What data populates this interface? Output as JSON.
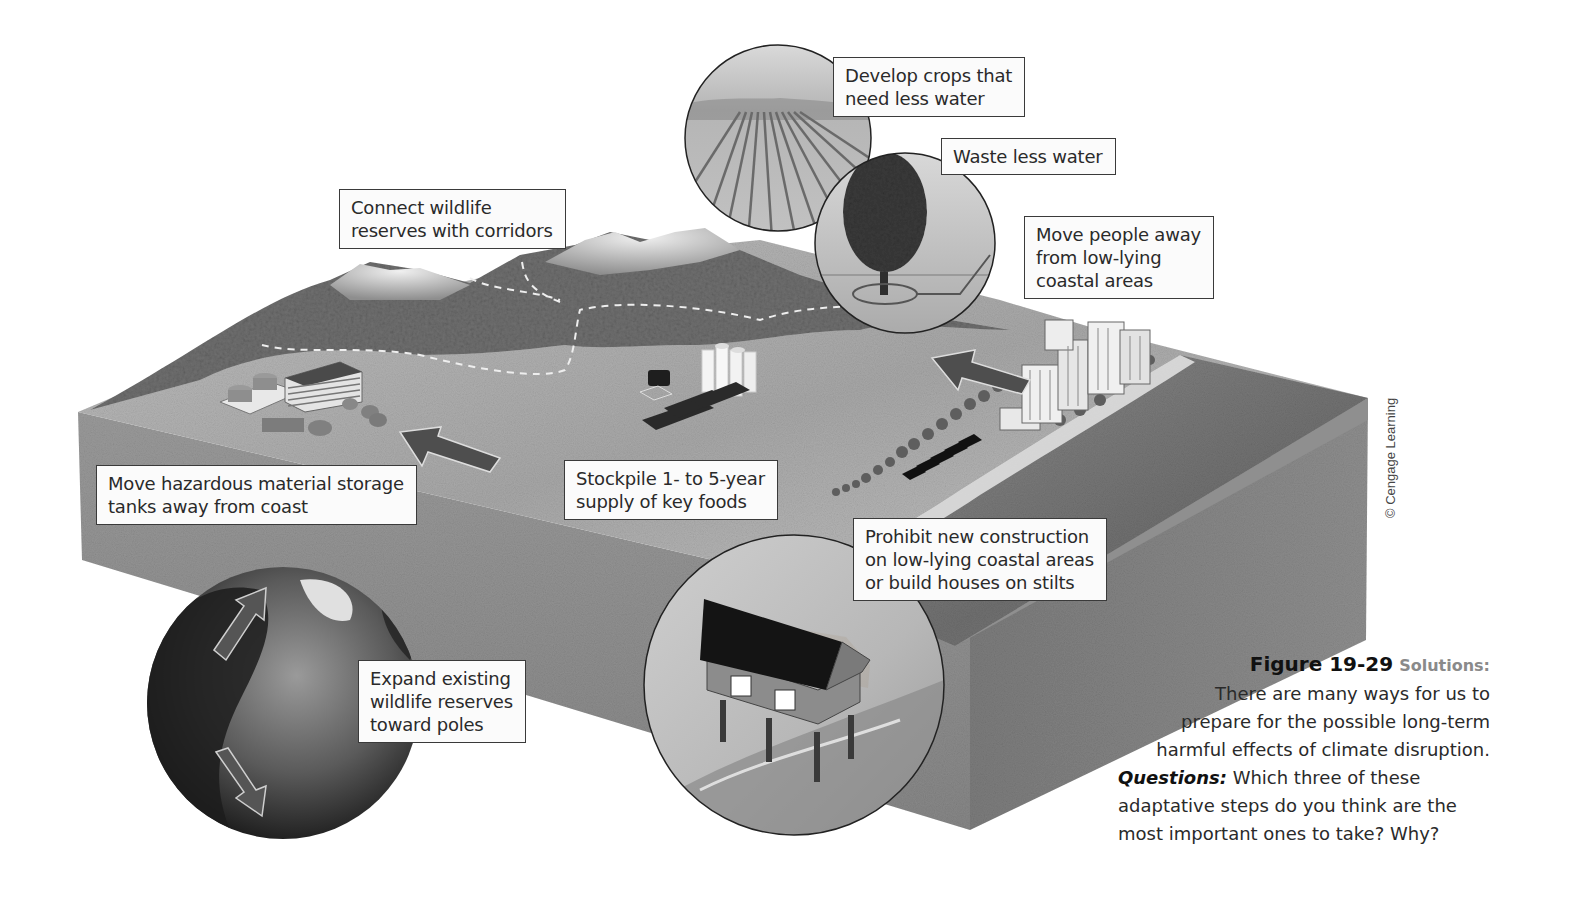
{
  "figure": {
    "number": "Figure 19-29",
    "kicker": "Solutions:",
    "description_lines": [
      "There are many ways for us to",
      "prepare for the possible long-term",
      "harmful effects of climate disruption."
    ],
    "questions_label": "Questions:",
    "question_lines": [
      "Which three of these",
      "adaptative steps do you think are the",
      "most important ones to take? Why?"
    ],
    "credit": "© Cengage Learning"
  },
  "labels": {
    "crops": [
      "Develop crops that",
      "need less water"
    ],
    "water": [
      "Waste less water"
    ],
    "corridors": [
      "Connect wildlife",
      "reserves with corridors"
    ],
    "move_people": [
      "Move people away",
      "from low-lying",
      "coastal areas"
    ],
    "hazardous": [
      "Move hazardous material storage",
      "tanks away from coast"
    ],
    "stockpile": [
      "Stockpile 1- to 5-year",
      "supply of key foods"
    ],
    "prohibit": [
      "Prohibit new construction",
      "on low-lying coastal areas",
      "or build houses on stilts"
    ],
    "expand": [
      "Expand existing",
      "wildlife reserves",
      "toward poles"
    ]
  },
  "illustrations": {
    "crop_field_circle": "crop-rows-icon",
    "tree_circle": "tree-icon",
    "house_on_stilts_circle": "house-on-stilts-icon",
    "globe": "globe-icon",
    "mountains": "mountain-icon",
    "industrial_plant": "storage-tanks-icon",
    "silos": "grain-silo-icon",
    "city": "coastal-city-icon",
    "arrows": "arrow-icon"
  },
  "colors": {
    "background": "#ffffff",
    "label_fill": "#fbfbfb",
    "label_border": "#3a3a3a",
    "land_top": "#a9a9a9",
    "side_face": "#8a8a8a",
    "ocean": "#7a7a7a",
    "forest": "#6e6e6e",
    "arrow": "#4d4d4d"
  }
}
